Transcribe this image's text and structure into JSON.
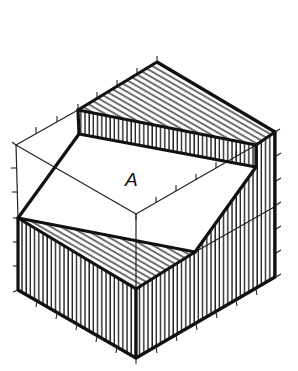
{
  "figure": {
    "type": "isometric technical drawing",
    "label_A": "A",
    "colors": {
      "ink": "#111111",
      "background": "#ffffff"
    }
  }
}
